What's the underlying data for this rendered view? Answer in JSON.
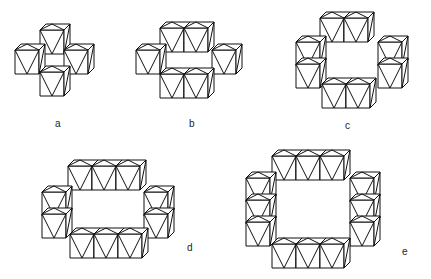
{
  "figure": {
    "panels": [
      {
        "id": "a",
        "label": "a",
        "description": "cross arrangement of octahedra (single tunnel, 1x1)",
        "label_pos": [
          57,
          124
        ]
      },
      {
        "id": "b",
        "label": "b",
        "description": "2x1 tunnel of octahedra",
        "label_pos": [
          192,
          124
        ]
      },
      {
        "id": "c",
        "label": "c",
        "description": "2x2 tunnel of octahedra",
        "label_pos": [
          347,
          126
        ]
      },
      {
        "id": "d",
        "label": "d",
        "description": "3x2 tunnel of octahedra",
        "label_pos": [
          190,
          248
        ]
      },
      {
        "id": "e",
        "label": "e",
        "description": "3x3 tunnel of octahedra",
        "label_pos": [
          405,
          252
        ]
      }
    ],
    "line_color": "#111111",
    "background": "#ffffff"
  }
}
